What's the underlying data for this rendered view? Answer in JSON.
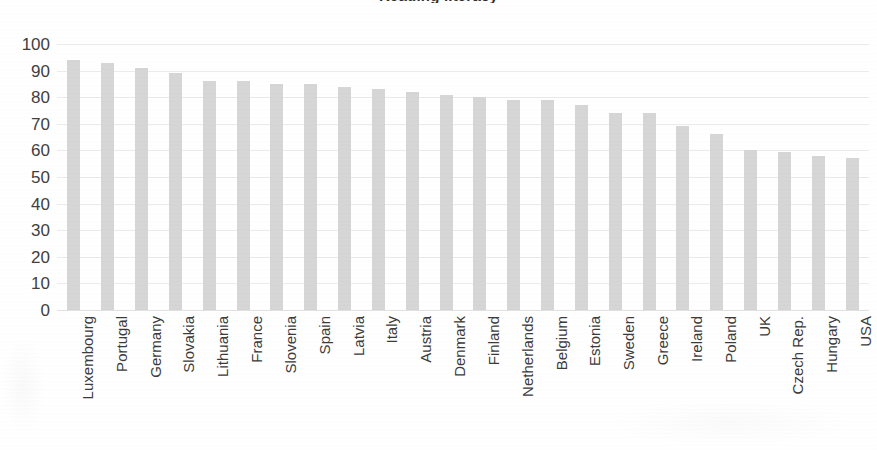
{
  "chart_data": {
    "type": "bar",
    "title": "Reading literacy",
    "title_note": "title is cropped off the top edge of the screenshot",
    "xlabel": "",
    "ylabel": "",
    "ylim": [
      0,
      100
    ],
    "ytick_step": 10,
    "ytick_labels": [
      "100",
      "90",
      "80",
      "70",
      "60",
      "50",
      "40",
      "30",
      "20",
      "10",
      "0"
    ],
    "ytick_values": [
      100,
      90,
      80,
      70,
      60,
      50,
      40,
      30,
      20,
      10,
      0
    ],
    "grid": true,
    "legend": "none",
    "bar_color": "#d6d6d6",
    "categories": [
      "Luxembourg",
      "Portugal",
      "Germany",
      "Slovakia",
      "Lithuania",
      "France",
      "Slovenia",
      "Spain",
      "Latvia",
      "Italy",
      "Austria",
      "Denmark",
      "Finland",
      "Netherlands",
      "Belgium",
      "Estonia",
      "Sweden",
      "Greece",
      "Ireland",
      "Poland",
      "UK",
      "Czech Rep.",
      "Hungary",
      "USA"
    ],
    "values": [
      94,
      93,
      91,
      89,
      86,
      86,
      85,
      85,
      84,
      83,
      82,
      81,
      80,
      79,
      79,
      77,
      74,
      74,
      69,
      66,
      60,
      59.5,
      58,
      57
    ]
  },
  "figure": {
    "background_color": "#ffffff",
    "axis_label_color": "#3b3b3b"
  }
}
